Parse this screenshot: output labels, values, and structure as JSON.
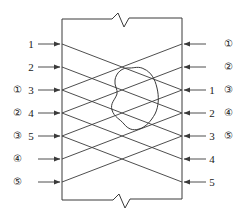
{
  "diagram": {
    "line_color": "#3a3a3a",
    "text_color": "#1a1a1a",
    "background": "#ffffff",
    "frame": {
      "left_rail_x": 62,
      "right_rail_x": 182,
      "top_y": 18,
      "bottom_y": 200,
      "top_break_symbol": "zigzag-break",
      "bottom_break_symbol": "zigzag-break"
    },
    "rows": {
      "count": 7,
      "first_y": 44,
      "spacing": 23
    },
    "left_inner_labels": [
      "1",
      "2",
      "3",
      "4",
      "5",
      "",
      ""
    ],
    "left_outer_labels": [
      "",
      "",
      "①",
      "②",
      "③",
      "④",
      "⑤"
    ],
    "right_inner_labels": [
      "",
      "",
      "1",
      "2",
      "3",
      "4",
      "5"
    ],
    "right_outer_labels": [
      "①",
      "②",
      "③",
      "④",
      "⑤",
      "",
      ""
    ],
    "blob": {
      "name": "fault-region",
      "center_x": 134,
      "center_y": 99
    },
    "connections": [
      {
        "from_row": 1,
        "to_row": 3
      },
      {
        "from_row": 2,
        "to_row": 4
      },
      {
        "from_row": 3,
        "to_row": 5
      },
      {
        "from_row": 4,
        "to_row": 6
      },
      {
        "from_row": 5,
        "to_row": 7
      },
      {
        "from_row": 3,
        "to_row": 1
      },
      {
        "from_row": 4,
        "to_row": 2
      },
      {
        "from_row": 5,
        "to_row": 3
      },
      {
        "from_row": 6,
        "to_row": 4
      },
      {
        "from_row": 7,
        "to_row": 5
      }
    ]
  }
}
